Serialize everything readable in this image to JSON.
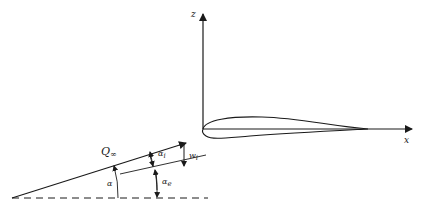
{
  "diagram": {
    "axes": {
      "z_label": "z",
      "x_label": "x"
    },
    "vectors": {
      "freestream_label": "Q",
      "freestream_subscript": "∞",
      "downwash_label": "w",
      "downwash_subscript": "i"
    },
    "angles": {
      "geometric_label": "α",
      "induced_label": "α",
      "induced_subscript": "i",
      "effective_label": "α",
      "effective_subscript": "e"
    },
    "colors": {
      "line": "#1a1a1a",
      "background": "#ffffff"
    }
  }
}
